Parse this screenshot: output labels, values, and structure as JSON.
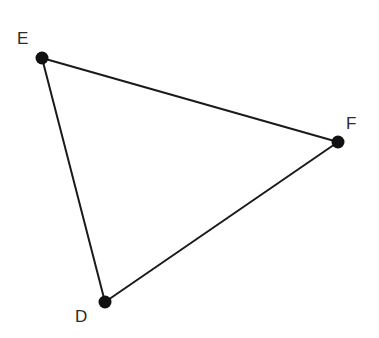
{
  "diagram": {
    "type": "triangle",
    "colors": {
      "background": "#ffffff",
      "line": "#1a1a1a",
      "point": "#111111",
      "label": "#2b2b2b"
    },
    "vertices": [
      {
        "id": "E",
        "label": "E",
        "x": 42,
        "y": 58,
        "label_x": 17,
        "label_y": 44
      },
      {
        "id": "F",
        "label": "F",
        "x": 338,
        "y": 142,
        "label_x": 346,
        "label_y": 129
      },
      {
        "id": "D",
        "label": "D",
        "x": 105,
        "y": 302,
        "label_x": 75,
        "label_y": 322
      }
    ],
    "edges": [
      {
        "from": "E",
        "to": "F",
        "name": "EF"
      },
      {
        "from": "F",
        "to": "D",
        "name": "FD"
      },
      {
        "from": "D",
        "to": "E",
        "name": "DE"
      }
    ]
  }
}
